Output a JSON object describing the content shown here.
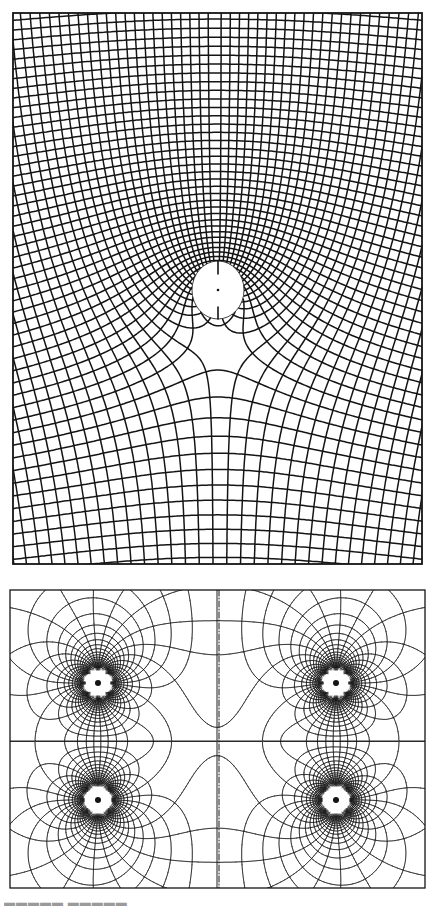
{
  "figure": {
    "background": "#ffffff",
    "ink": "#141414",
    "top_panel": {
      "title": "Conformal grid around a circular hole",
      "frame": {
        "x": 13,
        "y": 13,
        "width": 409,
        "height": 551
      },
      "hole": {
        "cx": 218,
        "cy": 290,
        "rx": 26,
        "ry": 29
      },
      "stroke_width": 1.5,
      "potential": {
        "uniform": 1.0,
        "source_strength": 55,
        "source_x": 218,
        "source_y": 290
      },
      "levels": {
        "phi_step": 11,
        "psi_step": 11
      }
    },
    "bottom_panel": {
      "title": "Field lines of four singular points",
      "frame": {
        "x": 10,
        "y": 590,
        "width": 415,
        "height": 298
      },
      "center_line_x": 219,
      "mid_line_y": 741,
      "stroke_width": 0.9,
      "singular_points": [
        {
          "x": 98,
          "y": 683,
          "strength": 1
        },
        {
          "x": 336,
          "y": 683,
          "strength": 1
        },
        {
          "x": 98,
          "y": 800,
          "strength": 1
        },
        {
          "x": 336,
          "y": 800,
          "strength": 1
        }
      ],
      "levels": {
        "phi_step": 0.26,
        "psi_step": 0.2
      }
    },
    "caption": {
      "text": "▬▬▬▬▬ ▬▬▬▬▬"
    }
  }
}
